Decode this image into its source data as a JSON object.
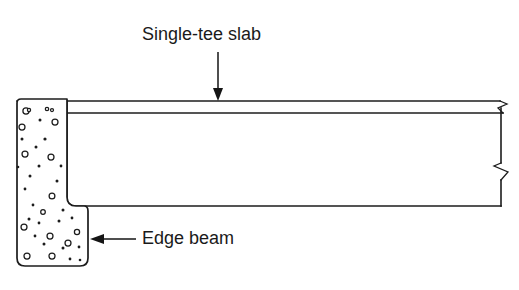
{
  "figure": {
    "type": "engineering-cross-section",
    "title_caption": "",
    "background_color": "#ffffff",
    "line_color": "#1c1c1c"
  },
  "labels": {
    "slab": {
      "text": "Single-tee slab",
      "x": 142,
      "y": 24
    },
    "beam": {
      "text": "Edge beam",
      "x": 142,
      "y": 228
    }
  },
  "annotations": {
    "slab_leader": {
      "name": "arrow-down",
      "direction": "down",
      "from_x": 218,
      "from_y": 52,
      "to_x": 218,
      "to_y": 101
    },
    "beam_leader": {
      "name": "arrow-left",
      "direction": "left",
      "from_x": 136,
      "from_y": 239,
      "to_x": 90,
      "to_y": 239
    }
  },
  "geometry": {
    "slab_top_y": 101,
    "slab_flange_y": 113,
    "slab_soffit_y": 206,
    "slab_right_x": 501,
    "web_left_x": 67,
    "beam_left_x": 17,
    "beam_right_x": 88,
    "beam_top_y": 99,
    "beam_bottom_y": 266,
    "beam_corner_radius": 9,
    "break_symbols": 2
  },
  "aggregate": {
    "description": "concrete aggregate stipple",
    "rings": [
      [
        26,
        111,
        3.1
      ],
      [
        29,
        110,
        1.6
      ],
      [
        47,
        109,
        1.7
      ],
      [
        52,
        110,
        1.5
      ],
      [
        55,
        122,
        3.0
      ],
      [
        22,
        127,
        3.0
      ],
      [
        25,
        154,
        3.0
      ],
      [
        51,
        157,
        3.0
      ],
      [
        52,
        196,
        2.9
      ],
      [
        24,
        227,
        3.0
      ],
      [
        50,
        236,
        3.0
      ],
      [
        68,
        243,
        3.0
      ],
      [
        27,
        256,
        3.0
      ],
      [
        52,
        256,
        3.0
      ],
      [
        77,
        232,
        2.6
      ],
      [
        43,
        212,
        2.3
      ]
    ],
    "dots": [
      [
        40,
        120,
        1.5
      ],
      [
        22,
        139,
        1.5
      ],
      [
        45,
        139,
        1.6
      ],
      [
        36,
        147,
        1.5
      ],
      [
        39,
        166,
        1.5
      ],
      [
        61,
        166,
        1.4
      ],
      [
        30,
        176,
        1.5
      ],
      [
        25,
        189,
        1.4
      ],
      [
        57,
        181,
        1.5
      ],
      [
        33,
        205,
        1.4
      ],
      [
        63,
        210,
        1.5
      ],
      [
        29,
        219,
        1.5
      ],
      [
        39,
        223,
        1.4
      ],
      [
        59,
        221,
        1.5
      ],
      [
        72,
        218,
        1.4
      ],
      [
        44,
        244,
        1.5
      ],
      [
        63,
        248,
        1.5
      ],
      [
        79,
        247,
        1.4
      ],
      [
        35,
        236,
        1.4
      ],
      [
        70,
        259,
        1.4
      ],
      [
        80,
        260,
        1.3
      ],
      [
        18,
        167,
        1.3
      ]
    ]
  }
}
